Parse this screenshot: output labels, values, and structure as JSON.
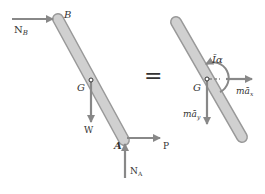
{
  "diagram": {
    "colors": {
      "rod_fill": "#c8c8c8",
      "rod_stroke": "#9a9a9a",
      "arrow": "#888888",
      "text": "#333333"
    },
    "fbd": {
      "labels": {
        "B": "B",
        "G": "G",
        "A": "A",
        "NB": "N",
        "NB_sub": "B",
        "W": "W",
        "P": "P",
        "NA": "N",
        "NA_sub": "A"
      }
    },
    "equals": "=",
    "kd": {
      "labels": {
        "G": "G",
        "Ialpha": "Īα",
        "max": "mā",
        "max_sub": "x",
        "may": "mā",
        "may_sub": "y"
      }
    }
  }
}
